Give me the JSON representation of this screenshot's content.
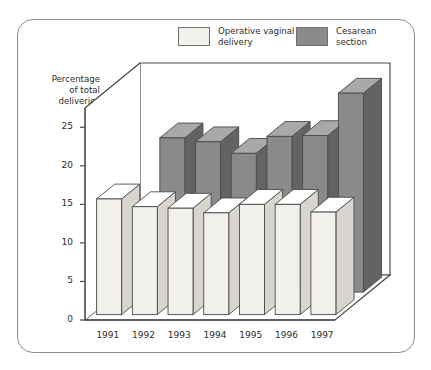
{
  "chart_data": {
    "type": "bar",
    "title": "",
    "subtitle": "",
    "xlabel": "",
    "ylabel": "Percentage\nof total\ndeliveries",
    "categories": [
      "1991",
      "1992",
      "1993",
      "1994",
      "1995",
      "1996",
      "1997"
    ],
    "series": [
      {
        "name": "Operative vaginal\ndelivery",
        "color": "#f2f0eb",
        "values": [
          15.0,
          14.0,
          13.8,
          13.2,
          14.3,
          14.3,
          13.3
        ]
      },
      {
        "name": "Cesarean\nsection",
        "color": "#8a8a8a",
        "values": [
          null,
          20.0,
          19.5,
          18.0,
          20.2,
          20.3,
          25.8
        ]
      }
    ],
    "ylim": [
      0,
      27.5
    ],
    "yticks": [
      "0",
      "5",
      "10",
      "15",
      "20",
      "25"
    ],
    "ytick_values": [
      0,
      5,
      10,
      15,
      20,
      25
    ],
    "grid": true,
    "legend_position": "top",
    "projection": "3d"
  },
  "legend": {
    "items": [
      {
        "label": "Operative vaginal\ndelivery",
        "swatch": "light-swatch"
      },
      {
        "label": "Cesarean\nsection",
        "swatch": "dark-swatch"
      }
    ]
  },
  "colors": {
    "bar_light_front": "#f2f0eb",
    "bar_light_top": "#ffffff",
    "bar_light_side": "#d8d5ce",
    "bar_dark_front": "#8a8a8a",
    "bar_dark_top": "#a9a9a9",
    "bar_dark_side": "#636363",
    "outline": "#4a4a4a",
    "frame": "#8d8d8d",
    "grid": "#e2e2e2",
    "text": "#2c2c2c"
  }
}
